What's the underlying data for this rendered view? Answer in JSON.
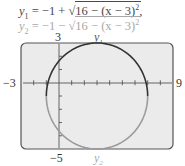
{
  "equations": {
    "y1": {
      "lhs": "y",
      "sub": "1",
      "rest": " = −1 + √",
      "radicand": "16 − (x − 3)",
      "sup": "2",
      "trail": ","
    },
    "y2": {
      "lhs": "y",
      "sub": "2",
      "rest": " = −1 − √",
      "radicand": "16 − (x − 3)",
      "sup": "2",
      "trail": ""
    }
  },
  "labels": {
    "ymax": "3",
    "ymin": "−5",
    "xmin": "−3",
    "xmax": "9",
    "curve_top": "y1",
    "curve_bottom": "y2"
  },
  "colors": {
    "frame_bg": "#ebebeb",
    "frame_border": "#555555",
    "y1_curve": "#333333",
    "y2_curve": "#9a9a9a",
    "axis": "#555555"
  },
  "chart_data": {
    "type": "line",
    "title": "",
    "xlabel": "",
    "ylabel": "",
    "xlim": [
      -3,
      9
    ],
    "ylim": [
      -5,
      3
    ],
    "xticks_step": 1,
    "yticks_step": 1,
    "grid": false,
    "legend": "curve labels y1 (top) and y2 (bottom)",
    "series": [
      {
        "name": "y1",
        "expression": "y1 = -1 + sqrt(16 - (x - 3)^2)",
        "color": "#333333",
        "x": [
          -1,
          -0.5,
          0,
          1,
          2,
          3,
          4,
          5,
          6,
          6.5,
          7
        ],
        "values": [
          -1,
          0.94,
          1.65,
          2.46,
          2.87,
          3,
          2.87,
          2.46,
          1.65,
          0.94,
          -1
        ]
      },
      {
        "name": "y2",
        "expression": "y2 = -1 - sqrt(16 - (x - 3)^2)",
        "color": "#9a9a9a",
        "x": [
          -1,
          -0.5,
          0,
          1,
          2,
          3,
          4,
          5,
          6,
          6.5,
          7
        ],
        "values": [
          -1,
          -2.94,
          -3.65,
          -4.46,
          -4.87,
          -5,
          -4.87,
          -4.46,
          -3.65,
          -2.94,
          -1
        ]
      }
    ],
    "annotations": [
      "3",
      "-5",
      "-3",
      "9",
      "y1",
      "y2"
    ]
  }
}
